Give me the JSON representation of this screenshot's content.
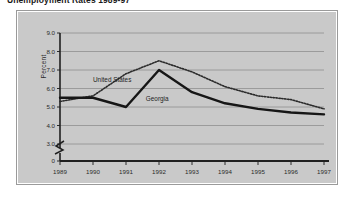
{
  "chart_data": {
    "type": "line",
    "title": "Unemployment Rates 1989-97",
    "xlabel": "",
    "ylabel": "Percent",
    "x": [
      "1989",
      "1990",
      "1991",
      "1992",
      "1993",
      "1994",
      "1995",
      "1996",
      "1997"
    ],
    "ylim": [
      3.0,
      9.0
    ],
    "yticks": [
      "0",
      "3.0",
      "4.0",
      "5.0",
      "6.0",
      "7.0",
      "8.0",
      "9.0"
    ],
    "ytick_values": [
      0,
      3.0,
      4.0,
      5.0,
      6.0,
      7.0,
      8.0,
      9.0
    ],
    "axis_break": true,
    "grid": "horizontal",
    "legend_position": "inline-annotation",
    "series": [
      {
        "name": "United States",
        "style": "dotted",
        "color": "#2b2b2b",
        "values": [
          5.3,
          5.6,
          6.8,
          7.5,
          6.9,
          6.1,
          5.6,
          5.4,
          4.9
        ]
      },
      {
        "name": "Georgia",
        "style": "solid",
        "color": "#161616",
        "values": [
          5.5,
          5.5,
          5.0,
          7.0,
          5.8,
          5.2,
          4.9,
          4.7,
          4.6
        ]
      }
    ],
    "annotations": [
      {
        "text": "United States",
        "x": 1990.0,
        "y": 6.35
      },
      {
        "text": "Georgia",
        "x": 1991.6,
        "y": 5.35
      }
    ]
  }
}
